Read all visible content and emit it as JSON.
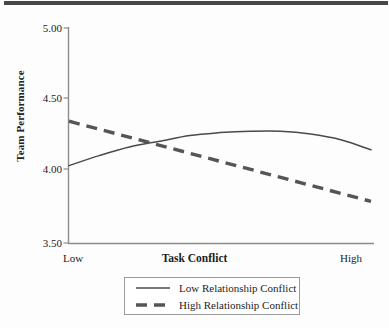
{
  "figure": {
    "background_color": "#fdfdfd",
    "top_bar_color": "#474747",
    "axis_color": "#8c8c8c",
    "line_color": "#4a4a4a",
    "dash_color": "#555555"
  },
  "chart_data": {
    "type": "line",
    "title": "",
    "xlabel": "Task Conflict",
    "ylabel": "Team Performance",
    "xticklabels": [
      "Low",
      "High"
    ],
    "yticklabels": [
      "3.50",
      "4.00",
      "4.50",
      "5.00"
    ],
    "ytickvalues": [
      3.5,
      4.0,
      4.5,
      5.0
    ],
    "ylim": [
      3.5,
      5.0
    ],
    "xlim": [
      0,
      1
    ],
    "grid": false,
    "legend_position": "below-axes",
    "series": [
      {
        "name": "Low Relationship Conflict",
        "style": "solid",
        "color": "#4a4a4a",
        "x": [
          0.0,
          0.1,
          0.2,
          0.3,
          0.4,
          0.5,
          0.6,
          0.7,
          0.8,
          0.9,
          1.0
        ],
        "values": [
          4.04,
          4.11,
          4.17,
          4.21,
          4.25,
          4.27,
          4.28,
          4.28,
          4.26,
          4.22,
          4.15
        ]
      },
      {
        "name": "High Relationship Conflict",
        "style": "dashed",
        "color": "#555555",
        "x": [
          0.0,
          1.0
        ],
        "values": [
          4.35,
          3.79
        ]
      }
    ],
    "annotations": []
  },
  "legend": {
    "items": [
      {
        "label": "Low Relationship Conflict",
        "style": "solid"
      },
      {
        "label": "High Relationship Conflict",
        "style": "dashed"
      }
    ]
  }
}
